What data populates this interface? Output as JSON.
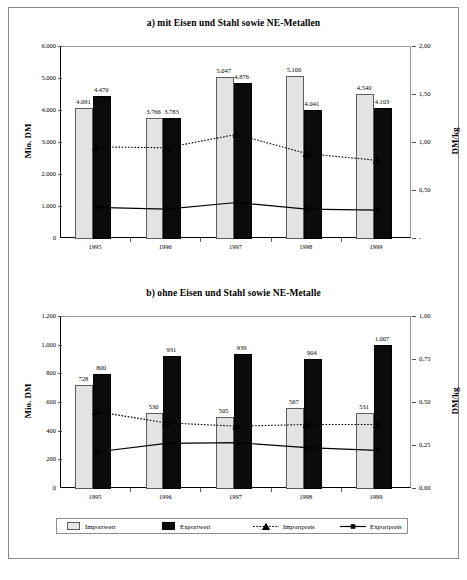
{
  "figure": {
    "background": "#ffffff",
    "frame_color": "#8a8a8a"
  },
  "legend": {
    "items": [
      {
        "label": "Importwert",
        "marker": "import-swatch",
        "color": "#e3e3e3"
      },
      {
        "label": "Exportwert",
        "marker": "export-swatch",
        "color": "#0b0b0b"
      },
      {
        "label": "Importpreis",
        "marker": "dotted-line-triangle",
        "color": "#000000"
      },
      {
        "label": "Exportpreis",
        "marker": "solid-line-square",
        "color": "#000000"
      }
    ]
  },
  "chart_data": [
    {
      "id": "chart-a",
      "type": "bar",
      "title": "a) mit Eisen und Stahl sowie NE-Metallen",
      "categories": [
        "1995",
        "1996",
        "1997",
        "1998",
        "1999"
      ],
      "xlabel": "",
      "ylabel": "Mio. DM",
      "y2label": "DM/kg",
      "ylim": [
        0,
        6000
      ],
      "yticks": [
        0,
        1000,
        2000,
        3000,
        4000,
        5000,
        6000
      ],
      "ytick_labels": [
        "0",
        "1.000",
        "2.000",
        "3.000",
        "4.000",
        "5.000",
        "6.000"
      ],
      "y2lim": [
        0,
        2.0
      ],
      "y2ticks": [
        0,
        0.5,
        1.0,
        1.5,
        2.0
      ],
      "y2tick_labels": [
        "-",
        "0,50",
        "1,00",
        "1,50",
        "2,00"
      ],
      "grid": false,
      "legend_position": "bottom",
      "series": [
        {
          "name": "Importwert",
          "axis": "left",
          "kind": "bar",
          "values": [
            4091,
            3766,
            5047,
            5100,
            4540
          ],
          "value_labels": [
            "4.091",
            "3.766",
            "5.047",
            "5.100",
            "4.540"
          ]
        },
        {
          "name": "Exportwert",
          "axis": "left",
          "kind": "bar",
          "values": [
            4470,
            3783,
            4876,
            4041,
            4103
          ],
          "value_labels": [
            "4.470",
            "3.783",
            "4.876",
            "4.041",
            "4.103"
          ]
        },
        {
          "name": "Importpreis",
          "axis": "right",
          "kind": "line-dotted",
          "values": [
            0.96,
            0.95,
            1.09,
            0.89,
            0.82
          ]
        },
        {
          "name": "Exportpreis",
          "axis": "right",
          "kind": "line-solid",
          "values": [
            0.33,
            0.31,
            0.38,
            0.31,
            0.3
          ]
        }
      ]
    },
    {
      "id": "chart-b",
      "type": "bar",
      "title": "b) ohne Eisen und Stahl sowie NE-Metalle",
      "categories": [
        "1995",
        "1996",
        "1997",
        "1998",
        "1999"
      ],
      "xlabel": "",
      "ylabel": "Mio. DM",
      "y2label": "DM/kg",
      "ylim": [
        0,
        1200
      ],
      "yticks": [
        0,
        200,
        400,
        600,
        800,
        1000,
        1200
      ],
      "ytick_labels": [
        "0",
        "200",
        "400",
        "600",
        "800",
        "1.000",
        "1.200"
      ],
      "y2lim": [
        0,
        1.0
      ],
      "y2ticks": [
        0,
        0.25,
        0.5,
        0.75,
        1.0
      ],
      "y2tick_labels": [
        "0,00",
        "0,25",
        "0,50",
        "0,75",
        "1,00"
      ],
      "grid": false,
      "legend_position": "bottom",
      "series": [
        {
          "name": "Importwert",
          "axis": "left",
          "kind": "bar",
          "values": [
            728,
            530,
            505,
            567,
            531
          ],
          "value_labels": [
            "728",
            "530",
            "505",
            "567",
            "531"
          ]
        },
        {
          "name": "Exportwert",
          "axis": "left",
          "kind": "bar",
          "values": [
            800,
            931,
            939,
            904,
            1007
          ],
          "value_labels": [
            "800",
            "931",
            "939",
            "904",
            "1.007"
          ]
        },
        {
          "name": "Importpreis",
          "axis": "right",
          "kind": "line-dotted",
          "values": [
            0.45,
            0.385,
            0.365,
            0.375,
            0.375
          ]
        },
        {
          "name": "Exportpreis",
          "axis": "right",
          "kind": "line-solid",
          "values": [
            0.215,
            0.265,
            0.27,
            0.24,
            0.225
          ]
        }
      ]
    }
  ]
}
